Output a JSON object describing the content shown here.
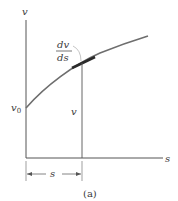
{
  "figure": {
    "caption": "(a)",
    "axes": {
      "y_label": "v",
      "x_label": "s"
    },
    "labels": {
      "initial_value": "v",
      "initial_value_sub": "0",
      "ordinate_value": "v",
      "slope_numerator": "dv",
      "slope_denominator": "ds",
      "abscissa_dimension": "s"
    },
    "colors": {
      "axis": "#555555",
      "curve": "#6e6e6e",
      "tangent": "#2a2a2a",
      "text": "#3a3a3a"
    }
  }
}
